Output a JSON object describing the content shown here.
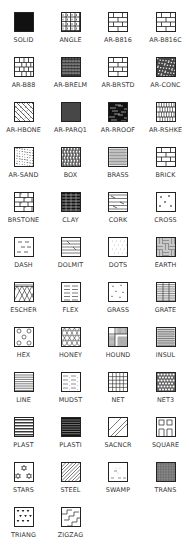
{
  "palette": {
    "patterns": [
      {
        "name": "SOLID",
        "icon": "solid"
      },
      {
        "name": "ANGLE",
        "icon": "angle"
      },
      {
        "name": "AR-B816",
        "icon": "brick"
      },
      {
        "name": "AR-B816C",
        "icon": "brick"
      },
      {
        "name": "AR-B88",
        "icon": "brick-small"
      },
      {
        "name": "AR-BRELM",
        "icon": "brelm"
      },
      {
        "name": "AR-BRSTD",
        "icon": "brick"
      },
      {
        "name": "AR-CONC",
        "icon": "conc"
      },
      {
        "name": "AR-HBONE",
        "icon": "hbone"
      },
      {
        "name": "AR-PARQ1",
        "icon": "parq"
      },
      {
        "name": "AR-RROOF",
        "icon": "rroof"
      },
      {
        "name": "AR-RSHKE",
        "icon": "rshke"
      },
      {
        "name": "AR-SAND",
        "icon": "sand"
      },
      {
        "name": "BOX",
        "icon": "box"
      },
      {
        "name": "BRASS",
        "icon": "brass"
      },
      {
        "name": "BRICK",
        "icon": "brick"
      },
      {
        "name": "BRSTONE",
        "icon": "brstone"
      },
      {
        "name": "CLAY",
        "icon": "clay"
      },
      {
        "name": "CORK",
        "icon": "cork"
      },
      {
        "name": "CROSS",
        "icon": "cross"
      },
      {
        "name": "DASH",
        "icon": "dash"
      },
      {
        "name": "DOLMIT",
        "icon": "dolmit"
      },
      {
        "name": "DOTS",
        "icon": "dots"
      },
      {
        "name": "EARTH",
        "icon": "earth"
      },
      {
        "name": "ESCHER",
        "icon": "escher"
      },
      {
        "name": "FLEX",
        "icon": "flex"
      },
      {
        "name": "GRASS",
        "icon": "grass"
      },
      {
        "name": "GRATE",
        "icon": "grate"
      },
      {
        "name": "HEX",
        "icon": "hex"
      },
      {
        "name": "HONEY",
        "icon": "honey"
      },
      {
        "name": "HOUND",
        "icon": "hound"
      },
      {
        "name": "INSUL",
        "icon": "insul"
      },
      {
        "name": "LINE",
        "icon": "line"
      },
      {
        "name": "MUDST",
        "icon": "mudst"
      },
      {
        "name": "NET",
        "icon": "net"
      },
      {
        "name": "NET3",
        "icon": "net3"
      },
      {
        "name": "PLAST",
        "icon": "plast"
      },
      {
        "name": "PLASTI",
        "icon": "plasti"
      },
      {
        "name": "SACNCR",
        "icon": "sacncr"
      },
      {
        "name": "SQUARE",
        "icon": "square"
      },
      {
        "name": "STARS",
        "icon": "stars"
      },
      {
        "name": "STEEL",
        "icon": "steel"
      },
      {
        "name": "SWAMP",
        "icon": "swamp"
      },
      {
        "name": "TRANS",
        "icon": "trans"
      },
      {
        "name": "TRIANG",
        "icon": "triang"
      },
      {
        "name": "ZIGZAG",
        "icon": "zigzag"
      }
    ]
  }
}
